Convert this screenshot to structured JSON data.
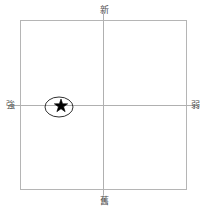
{
  "chart_data": {
    "type": "scatter",
    "title": "",
    "subtitle": "",
    "xlabel": "",
    "ylabel": "",
    "grid": false,
    "legend": "none",
    "frame": {
      "left": 20,
      "top": 20,
      "right": 186,
      "bottom": 189,
      "color": "#b5b5b5"
    },
    "axes": {
      "vertical_x": 103,
      "horizontal_y": 105,
      "color": "#b0b0b0",
      "top_label": "新",
      "bottom_label": "舊",
      "left_label": "強",
      "right_label": "弱"
    },
    "x": [
      -0.5
    ],
    "y": [
      0.01
    ],
    "points": [
      {
        "marker": "star",
        "label": "",
        "color": "#000000",
        "px": 61,
        "py": 106,
        "size": 14,
        "highlight": {
          "shape": "ellipse",
          "cx": 59,
          "cy": 107,
          "rx": 14,
          "ry": 10,
          "stroke": "#1a1a1a"
        }
      }
    ],
    "xlim": [
      -1,
      1
    ],
    "ylim": [
      -1,
      1
    ]
  },
  "labels": {
    "top": "新",
    "bottom": "舊",
    "left": "強",
    "right": "弱"
  },
  "colors": {
    "background": "#ffffff",
    "frame": "#b5b5b5",
    "axis": "#b0b0b0",
    "marker": "#000000",
    "ellipse": "#1a1a1a",
    "label_text": "#4d4d4d"
  }
}
